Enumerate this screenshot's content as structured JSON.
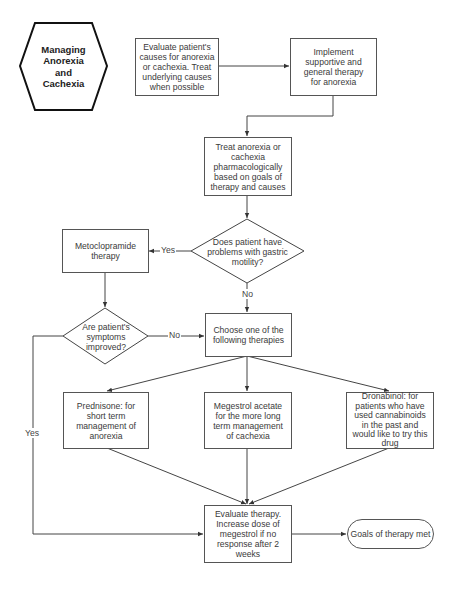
{
  "start": {
    "title": "Managing Anorexia and Cachexia",
    "lines": [
      "Managing",
      "Anorexia",
      "and",
      "Cachexia"
    ]
  },
  "nodes": {
    "evaluate_causes": "Evaluate patient's causes for anorexia or cachexia. Treat underlying causes when possible",
    "supportive_therapy": "Implement supportive and general therapy for anorexia",
    "pharmacologic": "Treat anorexia or cachexia pharmacologically based on goals of therapy and causes",
    "gastric_decision": "Does patient have problems with gastric motility?",
    "metoclopramide": "Metoclopramide therapy",
    "improved_decision": "Are patient's symptoms improved?",
    "choose_therapy": "Choose one of the following therapies",
    "prednisone": "Prednisone: for short term management of anorexia",
    "megestrol": "Megestrol acetate for the more long term management of cachexia",
    "dronabinol": "Dronabinol: for patients who have used cannabinoids in the past and would like to try this drug",
    "evaluate_therapy": "Evaluate therapy. Increase dose of megestrol if no response after 2 weeks",
    "goals_met": "Goals of therapy met"
  },
  "edge_labels": {
    "gastric_yes": "Yes",
    "gastric_no": "No",
    "improved_no": "No",
    "improved_yes": "Yes"
  },
  "colors": {
    "line": "#444444",
    "text": "#3a3a3a",
    "background": "#ffffff"
  }
}
